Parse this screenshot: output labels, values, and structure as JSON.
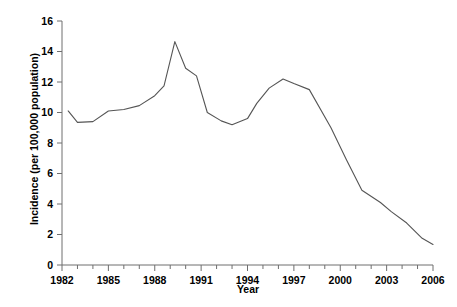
{
  "chart_data": {
    "type": "line",
    "title": "",
    "xlabel": "Year",
    "ylabel": "Incidence (per 100,000 population)",
    "xlim": [
      1982,
      2006
    ],
    "ylim": [
      0,
      16
    ],
    "grid": false,
    "legend": null,
    "x_tick_labels": [
      "1982",
      "1985",
      "1988",
      "1991",
      "1994",
      "1997",
      "2000",
      "2003",
      "2006"
    ],
    "x_tick_values": [
      1982,
      1985,
      1988,
      1991,
      1994,
      1997,
      2000,
      2003,
      2006
    ],
    "x_minor_ticks": [
      1983,
      1984,
      1986,
      1987,
      1989,
      1990,
      1992,
      1993,
      1995,
      1996,
      1998,
      1999,
      2001,
      2002,
      2004,
      2005
    ],
    "y_tick_labels": [
      "0",
      "2",
      "4",
      "6",
      "8",
      "10",
      "12",
      "14",
      "16"
    ],
    "y_tick_values": [
      0,
      2,
      4,
      6,
      8,
      10,
      12,
      14,
      16
    ],
    "line_color": "#555555",
    "x": [
      1982.4,
      1983,
      1984,
      1985,
      1986,
      1987,
      1988,
      1988.6,
      1989.3,
      1990,
      1990.7,
      1991.4,
      1992.3,
      1993,
      1994,
      1994.6,
      1995.4,
      1996.3,
      1997,
      1998,
      1999.4,
      2000.4,
      2001.4,
      2002.6,
      2003.3,
      2004.3,
      2005.3,
      2006
    ],
    "values": [
      10.1,
      9.35,
      9.4,
      10.1,
      10.2,
      10.45,
      11.1,
      11.75,
      14.65,
      12.9,
      12.4,
      10.0,
      9.45,
      9.2,
      9.6,
      10.6,
      11.6,
      12.2,
      11.9,
      11.5,
      9.0,
      6.9,
      4.9,
      4.1,
      3.5,
      2.75,
      1.75,
      1.35
    ],
    "series": [
      {
        "name": "Incidence",
        "points": [
          {
            "year": 1982.4,
            "value": 10.1
          },
          {
            "year": 1983.0,
            "value": 9.35
          },
          {
            "year": 1984.0,
            "value": 9.4
          },
          {
            "year": 1985.0,
            "value": 10.1
          },
          {
            "year": 1986.0,
            "value": 10.2
          },
          {
            "year": 1987.0,
            "value": 10.45
          },
          {
            "year": 1988.0,
            "value": 11.1
          },
          {
            "year": 1988.6,
            "value": 11.75
          },
          {
            "year": 1989.3,
            "value": 14.65
          },
          {
            "year": 1990.0,
            "value": 12.9
          },
          {
            "year": 1990.7,
            "value": 12.4
          },
          {
            "year": 1991.4,
            "value": 10.0
          },
          {
            "year": 1992.3,
            "value": 9.45
          },
          {
            "year": 1993.0,
            "value": 9.2
          },
          {
            "year": 1994.0,
            "value": 9.6
          },
          {
            "year": 1994.6,
            "value": 10.6
          },
          {
            "year": 1995.4,
            "value": 11.6
          },
          {
            "year": 1996.3,
            "value": 12.2
          },
          {
            "year": 1997.0,
            "value": 11.9
          },
          {
            "year": 1998.0,
            "value": 11.5
          },
          {
            "year": 1999.4,
            "value": 9.0
          },
          {
            "year": 2000.4,
            "value": 6.9
          },
          {
            "year": 2001.4,
            "value": 4.9
          },
          {
            "year": 2002.6,
            "value": 4.1
          },
          {
            "year": 2003.3,
            "value": 3.5
          },
          {
            "year": 2004.3,
            "value": 2.75
          },
          {
            "year": 2005.3,
            "value": 1.75
          },
          {
            "year": 2006.0,
            "value": 1.35
          }
        ]
      }
    ]
  }
}
